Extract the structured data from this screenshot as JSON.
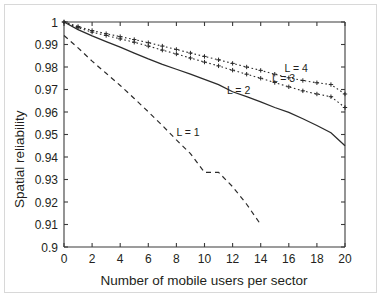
{
  "figure": {
    "background_color": "#ffffff",
    "frame_color": "#d8d8d8",
    "axis_color": "#3b3b3b",
    "curve_color": "#2b2b2b"
  },
  "chart_data": {
    "type": "line",
    "title": "",
    "xlabel": "Number of mobile users per sector",
    "ylabel": "Spatial reliability",
    "xlim": [
      0,
      20
    ],
    "ylim": [
      0.9,
      1
    ],
    "grid": false,
    "legend_position": "inline-annotations",
    "xticks": [
      0,
      2,
      4,
      6,
      8,
      10,
      12,
      14,
      16,
      18,
      20
    ],
    "xticklabels": [
      "0",
      "2",
      "4",
      "6",
      "8",
      "10",
      "12",
      "14",
      "16",
      "18",
      "20"
    ],
    "yticks": [
      0.9,
      0.91,
      0.92,
      0.93,
      0.94,
      0.95,
      0.96,
      0.97,
      0.98,
      0.99,
      1
    ],
    "yticklabels": [
      "0.9",
      "0.91",
      "0.92",
      "0.93",
      "0.94",
      "0.95",
      "0.96",
      "0.97",
      "0.98",
      "0.99",
      "1"
    ],
    "x": [
      0,
      1,
      2,
      3,
      4,
      5,
      6,
      7,
      8,
      9,
      10,
      11,
      12,
      13,
      14,
      15,
      16,
      17,
      18,
      19,
      20
    ],
    "series": [
      {
        "name": "L = 1",
        "label": "L = 1",
        "style": "dashed",
        "marker": "none",
        "annotation_x": 8.0,
        "annotation_y": 0.9495,
        "values": [
          0.994,
          0.9885,
          0.9826,
          0.9772,
          0.9718,
          0.966,
          0.9601,
          0.954,
          0.9476,
          0.9415,
          0.9332,
          0.9332,
          0.9268,
          0.919,
          0.91,
          null,
          null,
          null,
          null,
          null,
          null
        ]
      },
      {
        "name": "L = 2",
        "label": "L = 2",
        "style": "solid",
        "marker": "none",
        "annotation_x": 11.6,
        "annotation_y": 0.9678,
        "values": [
          1.0,
          0.9966,
          0.9938,
          0.9913,
          0.9888,
          0.9862,
          0.9836,
          0.9812,
          0.979,
          0.9768,
          0.9745,
          0.9722,
          0.969,
          0.9668,
          0.9645,
          0.962,
          0.9598,
          0.957,
          0.954,
          0.9508,
          0.945
        ]
      },
      {
        "name": "L = 3",
        "label": "L = 3",
        "style": "dotted",
        "marker": "plus",
        "annotation_x": 14.8,
        "annotation_y": 0.9735,
        "values": [
          1.0,
          0.9975,
          0.9955,
          0.994,
          0.9925,
          0.991,
          0.9893,
          0.9875,
          0.9858,
          0.984,
          0.9822,
          0.9805,
          0.9786,
          0.9768,
          0.975,
          0.9731,
          0.9712,
          0.9694,
          0.968,
          0.9668,
          0.962
        ]
      },
      {
        "name": "L = 4",
        "label": "L = 4",
        "style": "dotted",
        "marker": "plus",
        "annotation_x": 15.7,
        "annotation_y": 0.978,
        "values": [
          1.0,
          0.998,
          0.9962,
          0.9948,
          0.9935,
          0.9922,
          0.9908,
          0.9893,
          0.9878,
          0.9862,
          0.9847,
          0.9832,
          0.9816,
          0.98,
          0.9785,
          0.9768,
          0.9752,
          0.974,
          0.973,
          0.9722,
          0.968
        ]
      }
    ]
  }
}
